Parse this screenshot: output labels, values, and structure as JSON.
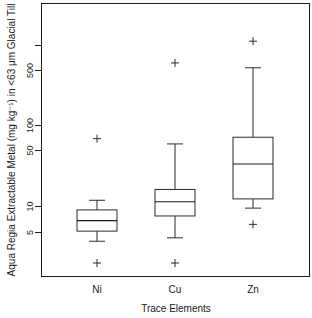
{
  "chart_data": {
    "type": "box",
    "title": "",
    "xlabel": "Trace Elements",
    "ylabel": "Aqua Regia Extractable Metal (mg kg⁻¹) in <63 μm Glacial Till",
    "yscale": "log",
    "ylim": [
      1.8,
      1400
    ],
    "grid": false,
    "legend": "none",
    "ytick_values": [
      5,
      10,
      50,
      100,
      500,
      1000
    ],
    "ytick_labels": [
      "5",
      "10",
      "50",
      "100",
      "500",
      ""
    ],
    "categories": [
      "Ni",
      "Cu",
      "Zn"
    ],
    "boxes": [
      {
        "name": "Ni",
        "whisker_low": 3.9,
        "q1": 5.2,
        "median": 7.0,
        "q3": 9.5,
        "whisker_high": 12.5,
        "outliers": [
          2.1,
          72
        ]
      },
      {
        "name": "Cu",
        "whisker_low": 4.3,
        "q1": 8.0,
        "median": 12.0,
        "q3": 17.0,
        "whisker_high": 62,
        "outliers": [
          2.1,
          620
        ]
      },
      {
        "name": "Zn",
        "whisker_low": 10.0,
        "q1": 13.0,
        "median": 35.0,
        "q3": 75.0,
        "whisker_high": 540,
        "outliers": [
          6.3,
          1150
        ]
      }
    ]
  },
  "axes": {
    "y_title": "Aqua Regia Extractable Metal (mg kg⁻¹) in <63 μm Glacial Till",
    "x_title": "Trace Elements",
    "y_labels": [
      "500",
      "100",
      "50",
      "10",
      "5"
    ],
    "x_labels": [
      "Ni",
      "Cu",
      "Zn"
    ]
  }
}
